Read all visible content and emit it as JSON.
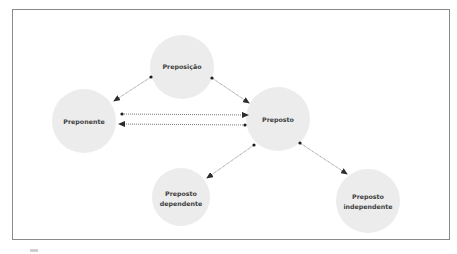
{
  "diagram": {
    "type": "concept-relationship",
    "colors": {
      "node_fill": "#ececec",
      "label": "#3f3f3f",
      "edge": "#555555",
      "frame": "#8a8a8a"
    },
    "nodes": [
      {
        "id": "preposicao",
        "lines": [
          "Preposição"
        ]
      },
      {
        "id": "preponente",
        "lines": [
          "Preponente"
        ]
      },
      {
        "id": "preposto",
        "lines": [
          "Preposto"
        ]
      },
      {
        "id": "preposto-dependente",
        "lines": [
          "Preposto",
          "dependente"
        ]
      },
      {
        "id": "preposto-independente",
        "lines": [
          "Preposto",
          "independente"
        ]
      }
    ],
    "edges": [
      {
        "from": "preposicao",
        "to": "preponente",
        "style": "solid"
      },
      {
        "from": "preposicao",
        "to": "preposto",
        "style": "solid"
      },
      {
        "from": "preponente",
        "to": "preposto",
        "style": "dotted"
      },
      {
        "from": "preposto",
        "to": "preponente",
        "style": "dotted"
      },
      {
        "from": "preposto",
        "to": "preposto-dependente",
        "style": "solid"
      },
      {
        "from": "preposto",
        "to": "preposto-independente",
        "style": "solid"
      }
    ]
  }
}
